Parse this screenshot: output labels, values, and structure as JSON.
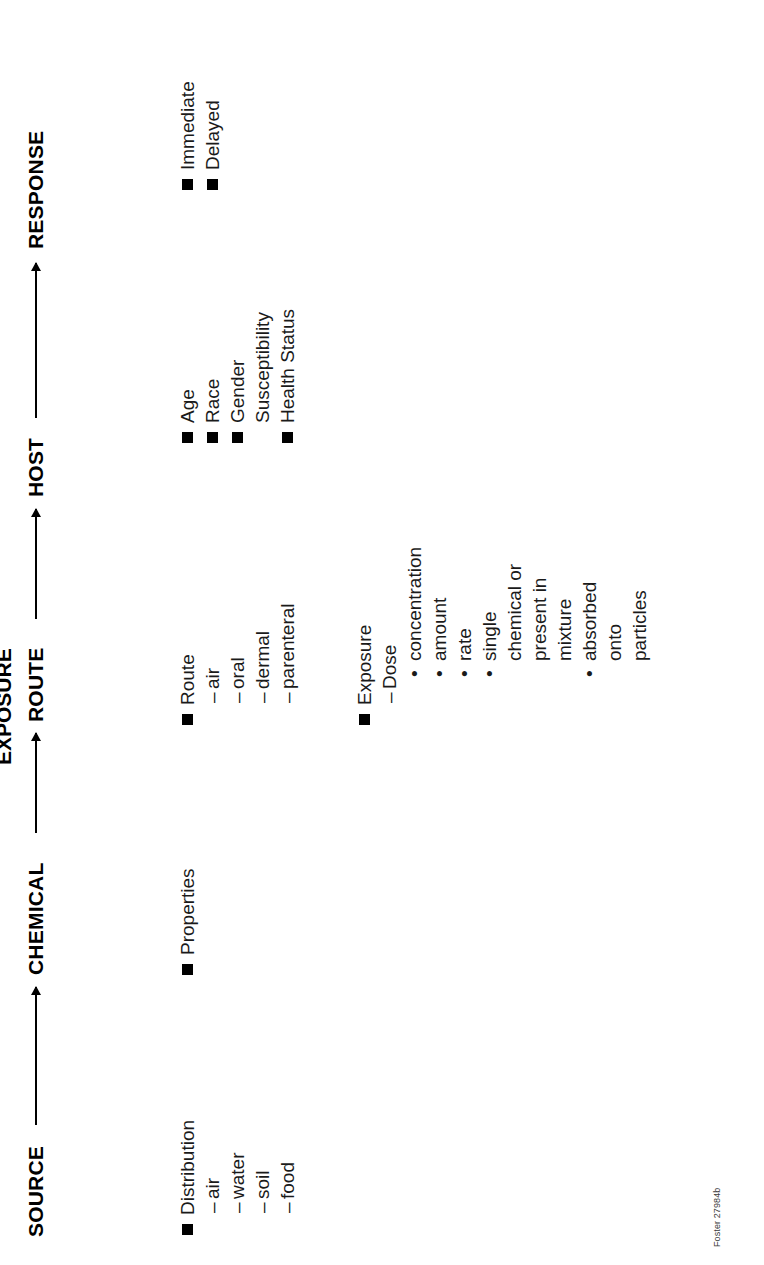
{
  "figure": {
    "title_chain": [
      "SOURCE",
      "CHEMICAL",
      "ROUTE",
      "HOST",
      "RESPONSE"
    ],
    "exposure_label": "EXPOSURE",
    "credit": "Foster 27984b"
  },
  "columns": {
    "source": {
      "header": "SOURCE",
      "items": [
        {
          "level": 1,
          "bullet": "square",
          "text": "Distribution"
        },
        {
          "level": 2,
          "bullet": "dash",
          "text": "air"
        },
        {
          "level": 2,
          "bullet": "dash",
          "text": "water"
        },
        {
          "level": 2,
          "bullet": "dash",
          "text": "soil"
        },
        {
          "level": 2,
          "bullet": "dash",
          "text": "food"
        }
      ]
    },
    "chemical": {
      "header": "CHEMICAL",
      "items": [
        {
          "level": 1,
          "bullet": "square",
          "text": "Properties"
        }
      ]
    },
    "route": {
      "header": "ROUTE",
      "items": [
        {
          "level": 1,
          "bullet": "square",
          "text": "Route"
        },
        {
          "level": 2,
          "bullet": "dash",
          "text": "air"
        },
        {
          "level": 2,
          "bullet": "dash",
          "text": "oral"
        },
        {
          "level": 2,
          "bullet": "dash",
          "text": "dermal"
        },
        {
          "level": 2,
          "bullet": "dash",
          "text": "parenteral"
        }
      ]
    },
    "exposure": {
      "header": "EXPOSURE",
      "items": [
        {
          "level": 1,
          "bullet": "square",
          "text": "Exposure"
        },
        {
          "level": 2,
          "bullet": "dash",
          "text": "Dose"
        },
        {
          "level": 3,
          "bullet": "dot",
          "text": "concentration"
        },
        {
          "level": 3,
          "bullet": "dot",
          "text": "amount"
        },
        {
          "level": 3,
          "bullet": "dot",
          "text": "rate"
        },
        {
          "level": 3,
          "bullet": "dot",
          "text": "single"
        },
        {
          "level": 3,
          "bullet": "none",
          "text": "chemical or"
        },
        {
          "level": 3,
          "bullet": "none",
          "text": "present in"
        },
        {
          "level": 3,
          "bullet": "none",
          "text": "mixture"
        },
        {
          "level": 3,
          "bullet": "dot",
          "text": "absorbed"
        },
        {
          "level": 3,
          "bullet": "none",
          "text": "onto"
        },
        {
          "level": 3,
          "bullet": "none",
          "text": "particles"
        }
      ]
    },
    "host": {
      "header": "HOST",
      "items": [
        {
          "level": 1,
          "bullet": "square",
          "text": "Age"
        },
        {
          "level": 1,
          "bullet": "square",
          "text": "Race"
        },
        {
          "level": 1,
          "bullet": "square",
          "text": "Gender"
        },
        {
          "level": 1,
          "bullet": "none",
          "text": "Susceptibility"
        },
        {
          "level": 1,
          "bullet": "square",
          "text": "Health Status"
        }
      ]
    },
    "response": {
      "header": "RESPONSE",
      "items": [
        {
          "level": 1,
          "bullet": "square",
          "text": "Immediate"
        },
        {
          "level": 1,
          "bullet": "square",
          "text": "Delayed"
        }
      ]
    }
  },
  "layout": {
    "chain_positions": [
      {
        "key": "source",
        "label_x": 28,
        "arrow_x": 138,
        "arrow_w": 140
      },
      {
        "key": "chemical",
        "label_x": 288,
        "arrow_x": 430,
        "arrow_w": 102
      },
      {
        "key": "route",
        "label_x": 542,
        "arrow_x": 645,
        "arrow_w": 110
      },
      {
        "key": "host",
        "label_x": 765,
        "arrow_x": 845,
        "arrow_w": 160
      },
      {
        "key": "response",
        "label_x": 1015,
        "arrow_x": 0,
        "arrow_w": 0
      }
    ],
    "exposure_x": 500,
    "column_x": {
      "source": 30,
      "chemical": 290,
      "route": 540,
      "exposure": 540,
      "host": 822,
      "response": 1075
    },
    "column_y": {
      "source": 175,
      "chemical": 175,
      "route": 175,
      "exposure": 352,
      "host": 175,
      "response": 175
    },
    "credit": {
      "x": 18,
      "y": 712
    }
  }
}
